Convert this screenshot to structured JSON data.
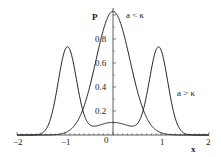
{
  "chart_data": {
    "type": "line",
    "title": "",
    "xlabel": "x",
    "ylabel": "P",
    "xlim": [
      -2,
      2
    ],
    "ylim": [
      0,
      1.05
    ],
    "grid": false,
    "x_ticks": [
      "-2",
      "-1",
      "0",
      "1",
      "2"
    ],
    "y_ticks": [
      "0.2",
      "0.4",
      "0.6",
      "0.8"
    ],
    "annotations": [
      {
        "text": "a < κ",
        "x": 0.45,
        "y": 0.95
      },
      {
        "text": "a > κ",
        "x": 1.35,
        "y": 0.4
      }
    ],
    "series": [
      {
        "name": "a < κ",
        "shape": "single peak centered at 0",
        "x": [
          -2,
          -1.5,
          -1.0,
          -0.5,
          0,
          0.5,
          1.0,
          1.5,
          2
        ],
        "values": [
          0.0,
          0.01,
          0.12,
          0.65,
          1.03,
          0.65,
          0.12,
          0.01,
          0.0
        ]
      },
      {
        "name": "a > κ",
        "shape": "double peak at ±0.95",
        "x": [
          -2,
          -1.5,
          -1.25,
          -0.95,
          -0.6,
          -0.3,
          0,
          0.3,
          0.6,
          0.95,
          1.25,
          1.5,
          2
        ],
        "values": [
          0.0,
          0.01,
          0.3,
          0.75,
          0.38,
          0.15,
          0.11,
          0.15,
          0.38,
          0.75,
          0.3,
          0.01,
          0.0
        ]
      }
    ]
  },
  "labels": {
    "y_axis": "P",
    "x_axis": "x",
    "origin": "0",
    "ann_left": "a < κ",
    "ann_right": "a > κ",
    "xt_m2": "−2",
    "xt_m1": "−1",
    "xt_1": "1",
    "xt_2": "2",
    "yt_02": "0.2",
    "yt_04": "0.4",
    "yt_06": "0.6",
    "yt_08": "0.8"
  }
}
